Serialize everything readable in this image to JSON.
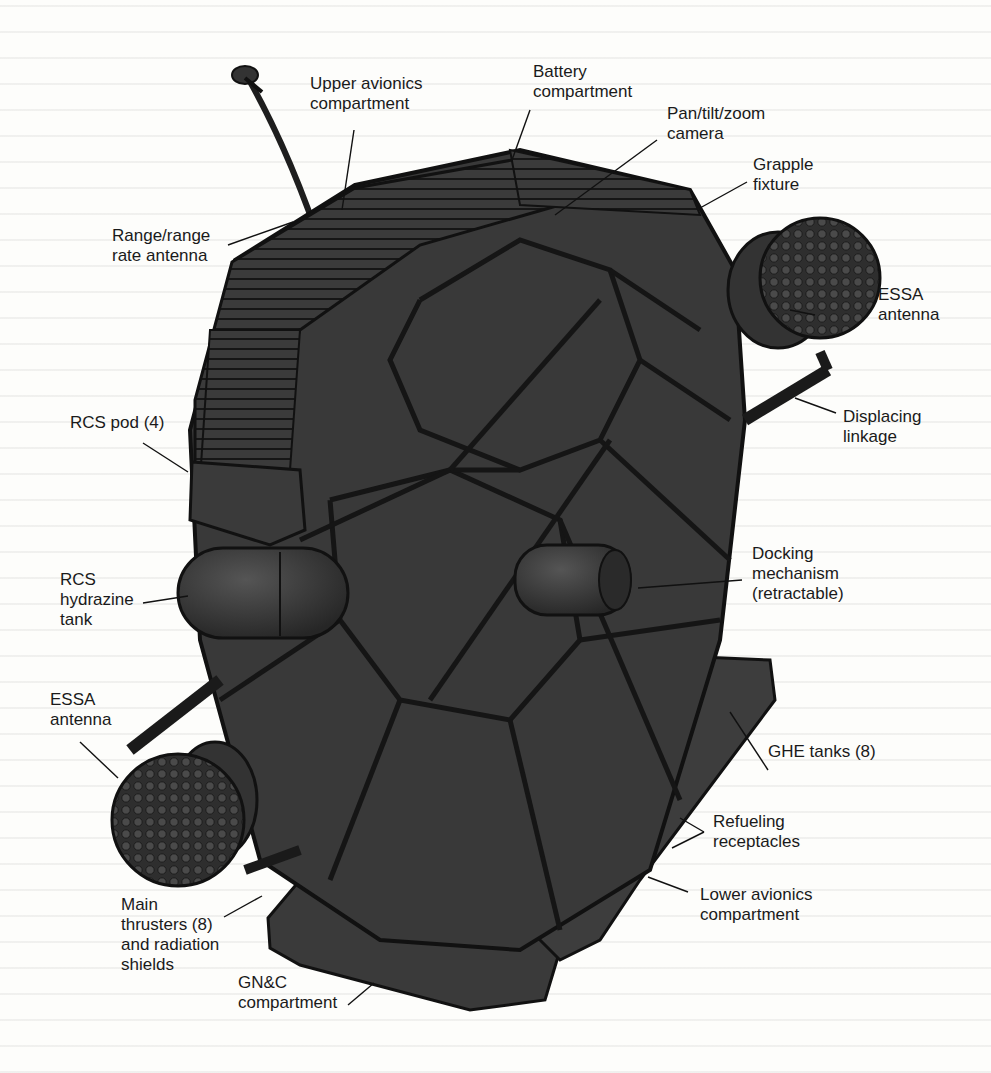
{
  "diagram": {
    "colors": {
      "background": "#fdfdfb",
      "body": "#3a3a3a",
      "frame": "#1c1c1c",
      "text": "#1a1a1a"
    },
    "labels": {
      "upper_avionics": [
        "Upper avionics",
        "compartment"
      ],
      "battery": [
        "Battery",
        "compartment"
      ],
      "camera": [
        "Pan/tilt/zoom",
        "camera"
      ],
      "grapple": [
        "Grapple",
        "fixture"
      ],
      "range_antenna": [
        "Range/range",
        "rate antenna"
      ],
      "essa_right": [
        "ESSA",
        "antenna"
      ],
      "displacing": [
        "Displacing",
        "linkage"
      ],
      "rcs_pod": [
        "RCS pod (4)"
      ],
      "rcs_tank": [
        "RCS",
        "hydrazine",
        "tank"
      ],
      "docking": [
        "Docking",
        "mechanism",
        "(retractable)"
      ],
      "essa_left": [
        "ESSA",
        "antenna"
      ],
      "ghe": [
        "GHE tanks (8)"
      ],
      "refueling": [
        "Refueling",
        "receptacles"
      ],
      "lower_avionics": [
        "Lower avionics",
        "compartment"
      ],
      "main_thrusters": [
        "Main",
        "thrusters (8)",
        "and radiation",
        "shields"
      ],
      "gnc": [
        "GN&C",
        "compartment"
      ]
    }
  }
}
